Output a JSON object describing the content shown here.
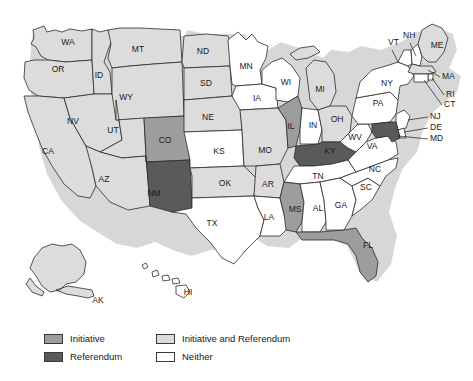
{
  "figure": {
    "name": "us-initiative-referendum-map",
    "background_color": "#ffffff"
  },
  "legend": {
    "items": [
      {
        "label": "Initiative",
        "color": "#9d9d9d",
        "column": 1
      },
      {
        "label": "Initiative and Referendum",
        "color": "#dcdcdc",
        "column": 2
      },
      {
        "label": "Referendum",
        "color": "#5a5a5a",
        "column": 1
      },
      {
        "label": "Neither",
        "color": "#ffffff",
        "column": 2
      }
    ]
  },
  "categories": {
    "initiative": "#9d9d9d",
    "initiative_and_referendum": "#dcdcdc",
    "referendum": "#5a5a5a",
    "neither": "#ffffff"
  },
  "chart_data": {
    "type": "map",
    "title": "",
    "legend_position": "bottom-left",
    "value_key": "category",
    "categories": [
      "Initiative",
      "Initiative and Referendum",
      "Referendum",
      "Neither"
    ],
    "states": [
      {
        "code": "WA",
        "category": "Initiative and Referendum"
      },
      {
        "code": "OR",
        "category": "Initiative and Referendum"
      },
      {
        "code": "CA",
        "category": "Initiative and Referendum"
      },
      {
        "code": "ID",
        "category": "Initiative and Referendum"
      },
      {
        "code": "NV",
        "category": "Initiative and Referendum"
      },
      {
        "code": "MT",
        "category": "Initiative and Referendum"
      },
      {
        "code": "WY",
        "category": "Initiative and Referendum"
      },
      {
        "code": "UT",
        "category": "Initiative and Referendum"
      },
      {
        "code": "AZ",
        "category": "Initiative and Referendum"
      },
      {
        "code": "CO",
        "category": "Initiative"
      },
      {
        "code": "NM",
        "category": "Referendum"
      },
      {
        "code": "ND",
        "category": "Initiative and Referendum"
      },
      {
        "code": "SD",
        "category": "Initiative and Referendum"
      },
      {
        "code": "NE",
        "category": "Initiative and Referendum"
      },
      {
        "code": "KS",
        "category": "Neither"
      },
      {
        "code": "OK",
        "category": "Initiative and Referendum"
      },
      {
        "code": "TX",
        "category": "Neither"
      },
      {
        "code": "MN",
        "category": "Neither"
      },
      {
        "code": "IA",
        "category": "Neither"
      },
      {
        "code": "MO",
        "category": "Initiative and Referendum"
      },
      {
        "code": "AR",
        "category": "Initiative and Referendum"
      },
      {
        "code": "LA",
        "category": "Neither"
      },
      {
        "code": "WI",
        "category": "Neither"
      },
      {
        "code": "IL",
        "category": "Initiative"
      },
      {
        "code": "MI",
        "category": "Initiative and Referendum"
      },
      {
        "code": "IN",
        "category": "Neither"
      },
      {
        "code": "OH",
        "category": "Initiative and Referendum"
      },
      {
        "code": "KY",
        "category": "Referendum"
      },
      {
        "code": "TN",
        "category": "Neither"
      },
      {
        "code": "MS",
        "category": "Initiative"
      },
      {
        "code": "AL",
        "category": "Neither"
      },
      {
        "code": "GA",
        "category": "Neither"
      },
      {
        "code": "FL",
        "category": "Initiative"
      },
      {
        "code": "SC",
        "category": "Neither"
      },
      {
        "code": "NC",
        "category": "Neither"
      },
      {
        "code": "VA",
        "category": "Neither"
      },
      {
        "code": "WV",
        "category": "Neither"
      },
      {
        "code": "PA",
        "category": "Neither"
      },
      {
        "code": "NY",
        "category": "Neither"
      },
      {
        "code": "VT",
        "category": "Neither"
      },
      {
        "code": "NH",
        "category": "Neither"
      },
      {
        "code": "ME",
        "category": "Initiative and Referendum"
      },
      {
        "code": "MA",
        "category": "Initiative and Referendum"
      },
      {
        "code": "RI",
        "category": "Neither"
      },
      {
        "code": "CT",
        "category": "Neither"
      },
      {
        "code": "NJ",
        "category": "Neither"
      },
      {
        "code": "DE",
        "category": "Neither"
      },
      {
        "code": "MD",
        "category": "Referendum"
      },
      {
        "code": "AK",
        "category": "Initiative and Referendum"
      },
      {
        "code": "HI",
        "category": "Neither"
      }
    ]
  },
  "map_labels": {
    "inline": [
      {
        "code": "WA",
        "text": "WA",
        "x": 68,
        "y": 43
      },
      {
        "code": "OR",
        "text": "OR",
        "x": 58,
        "y": 70
      },
      {
        "code": "CA",
        "text": "CA",
        "x": 48,
        "y": 152
      },
      {
        "code": "ID",
        "text": "ID",
        "x": 99,
        "y": 76
      },
      {
        "code": "NV",
        "text": "NV",
        "x": 73,
        "y": 122
      },
      {
        "code": "MT",
        "text": "MT",
        "x": 138,
        "y": 50
      },
      {
        "code": "WY",
        "text": "WY",
        "x": 126,
        "y": 98
      },
      {
        "code": "UT",
        "text": "UT",
        "x": 113,
        "y": 131
      },
      {
        "code": "AZ",
        "text": "AZ",
        "x": 104,
        "y": 180
      },
      {
        "code": "CO",
        "text": "CO",
        "x": 165,
        "y": 141
      },
      {
        "code": "NM",
        "text": "NM",
        "x": 154,
        "y": 194
      },
      {
        "code": "ND",
        "text": "ND",
        "x": 203,
        "y": 52
      },
      {
        "code": "SD",
        "text": "SD",
        "x": 206,
        "y": 84
      },
      {
        "code": "NE",
        "text": "NE",
        "x": 208,
        "y": 118
      },
      {
        "code": "KS",
        "text": "KS",
        "x": 219,
        "y": 152
      },
      {
        "code": "OK",
        "text": "OK",
        "x": 225,
        "y": 184
      },
      {
        "code": "TX",
        "text": "TX",
        "x": 212,
        "y": 224
      },
      {
        "code": "MN",
        "text": "MN",
        "x": 246,
        "y": 67
      },
      {
        "code": "IA",
        "text": "IA",
        "x": 257,
        "y": 99
      },
      {
        "code": "MO",
        "text": "MO",
        "x": 265,
        "y": 151
      },
      {
        "code": "AR",
        "text": "AR",
        "x": 268,
        "y": 185
      },
      {
        "code": "LA",
        "text": "LA",
        "x": 269,
        "y": 218
      },
      {
        "code": "WI",
        "text": "WI",
        "x": 286,
        "y": 83
      },
      {
        "code": "IL",
        "text": "IL",
        "x": 291,
        "y": 127
      },
      {
        "code": "MI",
        "text": "MI",
        "x": 320,
        "y": 90
      },
      {
        "code": "IN",
        "text": "IN",
        "x": 313,
        "y": 126
      },
      {
        "code": "OH",
        "text": "OH",
        "x": 337,
        "y": 120
      },
      {
        "code": "KY",
        "text": "KY",
        "x": 330,
        "y": 152
      },
      {
        "code": "TN",
        "text": "TN",
        "x": 318,
        "y": 177
      },
      {
        "code": "MS",
        "text": "MS",
        "x": 295,
        "y": 210
      },
      {
        "code": "AL",
        "text": "AL",
        "x": 318,
        "y": 209
      },
      {
        "code": "GA",
        "text": "GA",
        "x": 341,
        "y": 206
      },
      {
        "code": "FL",
        "text": "FL",
        "x": 368,
        "y": 246
      },
      {
        "code": "SC",
        "text": "SC",
        "x": 366,
        "y": 188
      },
      {
        "code": "NC",
        "text": "NC",
        "x": 375,
        "y": 170
      },
      {
        "code": "VA",
        "text": "VA",
        "x": 372,
        "y": 147
      },
      {
        "code": "WV",
        "text": "WV",
        "x": 355,
        "y": 138
      },
      {
        "code": "PA",
        "text": "PA",
        "x": 378,
        "y": 104
      },
      {
        "code": "NY",
        "text": "NY",
        "x": 387,
        "y": 84
      },
      {
        "code": "ME",
        "text": "ME",
        "x": 437,
        "y": 46
      },
      {
        "code": "AK",
        "text": "AK",
        "x": 98,
        "y": 301
      },
      {
        "code": "HI",
        "text": "HI",
        "x": 188,
        "y": 293
      }
    ],
    "callouts": [
      {
        "code": "VT",
        "text": "VT",
        "x": 388,
        "y": 43,
        "anchor": "start"
      },
      {
        "code": "NH",
        "text": "NH",
        "x": 403,
        "y": 36,
        "anchor": "start"
      },
      {
        "code": "MA",
        "text": "MA",
        "x": 442,
        "y": 77,
        "anchor": "start"
      },
      {
        "code": "RI",
        "text": "RI",
        "x": 446,
        "y": 95,
        "anchor": "start"
      },
      {
        "code": "CT",
        "text": "CT",
        "x": 444,
        "y": 105,
        "anchor": "start"
      },
      {
        "code": "NJ",
        "text": "NJ",
        "x": 430,
        "y": 117,
        "anchor": "start"
      },
      {
        "code": "DE",
        "text": "DE",
        "x": 430,
        "y": 128,
        "anchor": "start"
      },
      {
        "code": "MD",
        "text": "MD",
        "x": 430,
        "y": 139,
        "anchor": "start"
      }
    ]
  }
}
